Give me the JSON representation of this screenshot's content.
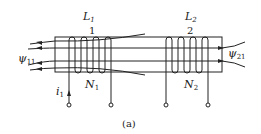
{
  "figure": {
    "caption": "(a)",
    "coil1": {
      "name": "L",
      "name_sub": "1",
      "terminal_mark": "1",
      "turns_label": "N",
      "turns_sub": "1"
    },
    "coil2": {
      "name": "L",
      "name_sub": "2",
      "terminal_mark": "2",
      "turns_label": "N",
      "turns_sub": "2"
    },
    "flux_left": {
      "symbol": "ψ",
      "sub": "11"
    },
    "flux_right": {
      "symbol": "ψ",
      "sub": "21"
    },
    "current": {
      "symbol": "i",
      "sub": "1"
    },
    "colors": {
      "line": "#222222",
      "background": "#ffffff"
    }
  }
}
